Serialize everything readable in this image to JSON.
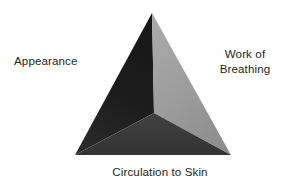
{
  "diagram": {
    "type": "pyramid",
    "background_color": "#ffffff",
    "text_color": "#231f20",
    "apex": {
      "x": 152,
      "y": 13
    },
    "bottom_left": {
      "x": 75,
      "y": 155
    },
    "bottom_right": {
      "x": 231,
      "y": 155
    },
    "front_vertex": {
      "x": 154,
      "y": 113
    },
    "faces": [
      {
        "id": "left-face",
        "name": "Appearance face",
        "fill_top": "#171717",
        "fill_bottom": "#282828",
        "points": "152,13 75,155 154,113"
      },
      {
        "id": "right-face",
        "name": "Work of Breathing face",
        "fill_top": "#a6a6a6",
        "fill_bottom": "#8e8e8e",
        "points": "152,13 231,155 154,113"
      },
      {
        "id": "bottom-face",
        "name": "Circulation to Skin face",
        "fill_top": "#3f3f3f",
        "fill_bottom": "#343434",
        "points": "154,113 75,155 231,155"
      }
    ],
    "labels": [
      {
        "id": "appearance",
        "text": "Appearance",
        "position": "left"
      },
      {
        "id": "work-of-breathing",
        "line1": "Work of",
        "line2": "Breathing",
        "position": "right"
      },
      {
        "id": "circulation-to-skin",
        "text": "Circulation to Skin",
        "position": "bottom"
      }
    ]
  }
}
